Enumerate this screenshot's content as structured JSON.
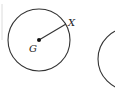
{
  "diagram": {
    "type": "geometry-circles",
    "circles": [
      {
        "name": "circle-G",
        "center_label": "G",
        "point_on_circle_label": "X",
        "radius_segment": "GX",
        "fully_visible": true
      },
      {
        "name": "circle-2",
        "fully_visible": false,
        "note": "partially visible at right edge"
      }
    ],
    "labels": {
      "center": "G",
      "point": "X"
    },
    "colors": {
      "stroke": "#333333",
      "background": "#ffffff",
      "edge_line": "#d8d8d8"
    }
  }
}
